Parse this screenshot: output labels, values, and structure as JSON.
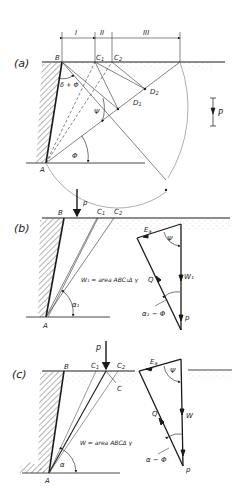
{
  "panels": {
    "a": {
      "tag": "(a)",
      "points": {
        "B": "B",
        "C1": "C",
        "C1_sub": "1",
        "C2": "C",
        "C2_sub": "2",
        "D1": "D",
        "D1_sub": "1",
        "D2": "D",
        "D2_sub": "2",
        "A": "A"
      },
      "dimensions": [
        "I",
        "II",
        "III"
      ],
      "angles": {
        "delta_phi": "δ + Φ",
        "psi": "Ψ",
        "phi": "Φ"
      },
      "load": "P"
    },
    "b": {
      "tag": "(b)",
      "points": {
        "B": "B",
        "C1": "C",
        "C1_sub": "1",
        "C2": "C",
        "C2_sub": "2",
        "A": "A"
      },
      "load": "p",
      "weight_formula": "W₁ = area ABC₁Δ γ",
      "angle_alpha": "α₁",
      "triangle": {
        "Ea": "E",
        "Ea_sub": "a",
        "psi": "Ψ",
        "W": "W₁",
        "Q": "Q",
        "p": "p",
        "alpha_phi": "α₁ − Φ"
      }
    },
    "c": {
      "tag": "(c)",
      "points": {
        "B": "B",
        "C1": "C",
        "C1_sub": "1",
        "C2": "C",
        "C2_sub": "2",
        "C": "C",
        "A": "A"
      },
      "load": "p",
      "weight_formula": "W = area ABCΔ γ",
      "angle_alpha": "α",
      "triangle": {
        "Ea": "E",
        "Ea_sub": "a",
        "psi": "Ψ",
        "W": "W",
        "Q": "Q",
        "p": "p",
        "alpha_phi": "α − Φ"
      }
    }
  },
  "colors": {
    "line": "#1a1a1a",
    "thin": "#555555",
    "hatch": "#444444",
    "soil": "#bbbbbb"
  }
}
